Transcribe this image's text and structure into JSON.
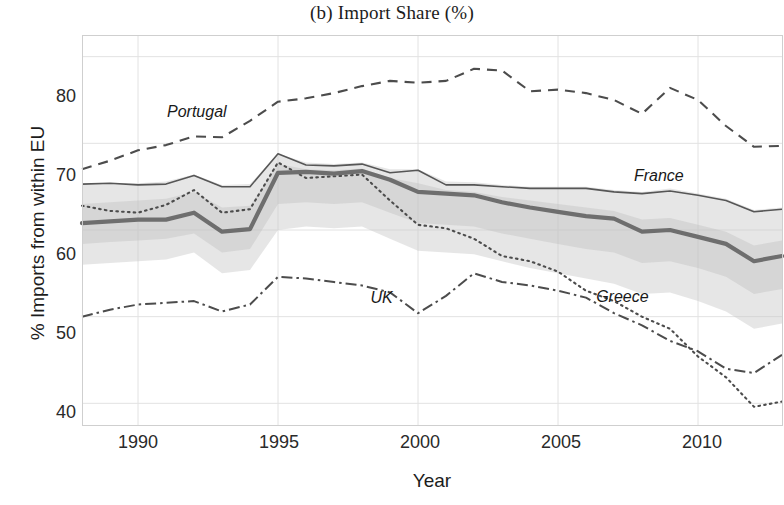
{
  "chart_data": {
    "type": "line",
    "title": "(b) Import Share (%)",
    "xlabel": "Year",
    "ylabel": "% Imports from within EU",
    "xlim": [
      1988,
      2013
    ],
    "ylim": [
      37.5,
      82.5
    ],
    "yticks": [
      40,
      50,
      60,
      70,
      80
    ],
    "xticks": [
      1990,
      1995,
      2000,
      2005,
      2010
    ],
    "grid": true,
    "legend_position": "inline-annotations",
    "x": [
      1988,
      1989,
      1990,
      1991,
      1992,
      1993,
      1994,
      1995,
      1996,
      1997,
      1998,
      1999,
      2000,
      2001,
      2002,
      2003,
      2004,
      2005,
      2006,
      2007,
      2008,
      2009,
      2010,
      2011,
      2012,
      2013
    ],
    "series": [
      {
        "name": "Portugal",
        "style": "dashed",
        "label_x": 1992.1,
        "label_y": 73.6,
        "values": [
          67.0,
          68.0,
          69.2,
          69.8,
          70.8,
          70.7,
          72.6,
          74.8,
          75.2,
          75.8,
          76.6,
          77.2,
          77.0,
          77.2,
          78.6,
          78.4,
          76.0,
          76.2,
          75.8,
          75.0,
          73.4,
          76.4,
          75.0,
          72.0,
          69.6,
          69.7
        ]
      },
      {
        "name": "France",
        "style": "solid-thin",
        "label_x": 2008.6,
        "label_y": 66.2,
        "values": [
          65.3,
          65.4,
          65.2,
          65.3,
          66.3,
          65.0,
          65.0,
          68.8,
          67.5,
          67.4,
          67.6,
          66.6,
          66.9,
          65.2,
          65.2,
          65.0,
          64.8,
          64.8,
          64.8,
          64.4,
          64.2,
          64.5,
          64.0,
          63.4,
          62.1,
          62.4
        ]
      },
      {
        "name": "EU average",
        "style": "solid-thick",
        "label_x": null,
        "label_y": null,
        "values": [
          60.8,
          61.0,
          61.2,
          61.2,
          62.0,
          59.8,
          60.1,
          66.6,
          66.7,
          66.5,
          66.8,
          65.8,
          64.4,
          64.2,
          64.0,
          63.2,
          62.6,
          62.1,
          61.6,
          61.3,
          59.8,
          60.0,
          59.2,
          58.4,
          56.4,
          57.0
        ]
      },
      {
        "name": "Greece",
        "style": "dotted",
        "label_x": 2007.3,
        "label_y": 52.3,
        "values": [
          62.8,
          62.2,
          62.0,
          62.9,
          64.6,
          62.0,
          62.4,
          67.8,
          66.0,
          66.2,
          66.4,
          63.4,
          60.6,
          60.2,
          59.0,
          57.0,
          56.4,
          55.2,
          53.0,
          51.8,
          50.0,
          48.6,
          45.4,
          43.0,
          39.6,
          40.2
        ]
      },
      {
        "name": "UK",
        "style": "dash-dot",
        "label_x": 1998.7,
        "label_y": 52.2,
        "values": [
          50.0,
          50.8,
          51.4,
          51.6,
          51.8,
          50.6,
          51.4,
          54.6,
          54.4,
          54.0,
          53.6,
          52.8,
          50.4,
          52.4,
          55.0,
          54.0,
          53.6,
          53.0,
          52.2,
          50.4,
          49.0,
          47.2,
          46.0,
          44.0,
          43.5,
          45.6
        ]
      }
    ],
    "band_upper": [
      65.3,
      65.4,
      65.4,
      65.6,
      66.4,
      65.2,
      65.3,
      68.8,
      67.8,
      67.6,
      67.8,
      67.0,
      67.0,
      65.6,
      65.5,
      65.2,
      65.0,
      65.0,
      65.0,
      64.6,
      64.4,
      64.8,
      64.2,
      63.6,
      62.3,
      62.6
    ],
    "band_lower": [
      56.0,
      56.2,
      56.4,
      56.6,
      57.4,
      55.0,
      55.4,
      60.0,
      60.4,
      60.2,
      60.4,
      59.0,
      57.6,
      57.4,
      57.2,
      56.4,
      55.6,
      55.0,
      54.4,
      53.8,
      52.6,
      52.8,
      51.8,
      50.6,
      48.6,
      49.2
    ],
    "band2_upper": [
      63.0,
      63.2,
      63.4,
      63.6,
      64.4,
      62.6,
      62.8,
      67.6,
      67.0,
      66.9,
      67.1,
      66.0,
      65.4,
      64.6,
      64.4,
      63.8,
      63.4,
      63.0,
      62.6,
      62.2,
      61.2,
      61.4,
      60.6,
      59.8,
      58.2,
      58.8
    ],
    "band2_lower": [
      58.4,
      58.6,
      58.8,
      59.0,
      59.6,
      57.4,
      57.8,
      63.0,
      63.2,
      63.0,
      63.2,
      62.0,
      60.8,
      60.6,
      60.4,
      59.6,
      59.0,
      58.4,
      57.8,
      57.4,
      56.2,
      56.4,
      55.6,
      54.6,
      52.6,
      53.2
    ]
  },
  "axes": {
    "ytick_labels": [
      "80",
      "70",
      "60",
      "50",
      "40"
    ],
    "xtick_labels": [
      "1990",
      "1995",
      "2000",
      "2005",
      "2010"
    ]
  },
  "labels": {
    "portugal": "Portugal",
    "france": "France",
    "greece": "Greece",
    "uk": "UK"
  },
  "colors": {
    "main_line": "#6e6e6e",
    "thin_line": "#565656",
    "dashed_line": "#4c4c4c",
    "band": "#c8c8c8",
    "grid": "#e2e2e2",
    "text": "#1c1c1c"
  }
}
